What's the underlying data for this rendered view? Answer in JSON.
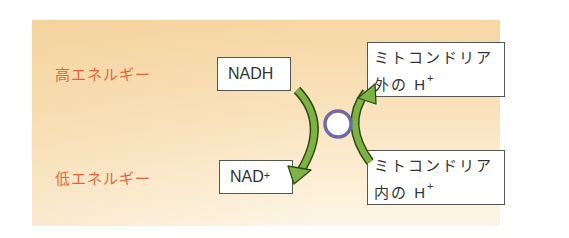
{
  "levels": {
    "high": "高エネルギー",
    "low": "低エネルギー"
  },
  "left": {
    "top_box": "NADH",
    "bottom_box_main": "NAD",
    "bottom_box_sup": "+"
  },
  "right": {
    "top_box_line1": "ミトコンドリア",
    "top_box_line2": "外の H",
    "top_box_sup": "+",
    "bottom_box_line1": "ミトコンドリア",
    "bottom_box_line2": "内の H",
    "bottom_box_sup": "+"
  },
  "colors": {
    "label_orange": "#e0663a",
    "arrow_green": "#7cb342",
    "arrow_outline": "#2f4a1a",
    "circle_stroke": "#6e6aa8",
    "panel_top": "#f6d7a4",
    "panel_bottom": "#fdf5e6"
  }
}
